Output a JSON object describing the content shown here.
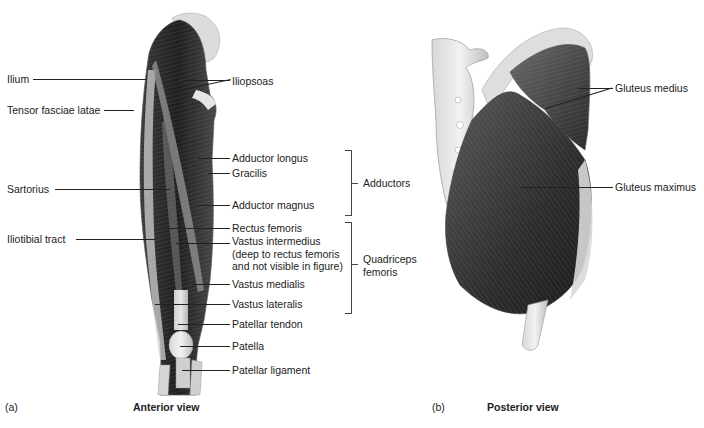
{
  "figure": {
    "panel_a": {
      "letter": "(a)",
      "title": "Anterior view",
      "left_labels": [
        {
          "id": "ilium",
          "text": "Ilium"
        },
        {
          "id": "tensor-fasciae-latae",
          "text": "Tensor fasciae latae"
        },
        {
          "id": "sartorius",
          "text": "Sartorius"
        },
        {
          "id": "iliotibial-tract",
          "text": "Iliotibial tract"
        }
      ],
      "right_labels": [
        {
          "id": "iliopsoas",
          "text": "Iliopsoas"
        },
        {
          "id": "adductor-longus",
          "text": "Adductor longus"
        },
        {
          "id": "gracilis",
          "text": "Gracilis"
        },
        {
          "id": "adductor-magnus",
          "text": "Adductor magnus"
        },
        {
          "id": "rectus-femoris",
          "text": "Rectus femoris"
        },
        {
          "id": "vastus-intermedius",
          "text": "Vastus intermedius\n(deep to rectus femoris\nand not visible in figure)"
        },
        {
          "id": "vastus-medialis",
          "text": "Vastus medialis"
        },
        {
          "id": "vastus-lateralis",
          "text": "Vastus lateralis"
        },
        {
          "id": "patellar-tendon",
          "text": "Patellar tendon"
        },
        {
          "id": "patella",
          "text": "Patella"
        },
        {
          "id": "patellar-ligament",
          "text": "Patellar ligament"
        }
      ],
      "groups": [
        {
          "id": "adductors",
          "text": "Adductors"
        },
        {
          "id": "quadriceps-femoris",
          "text": "Quadriceps\nfemoris"
        }
      ]
    },
    "panel_b": {
      "letter": "(b)",
      "title": "Posterior view",
      "labels": [
        {
          "id": "gluteus-medius",
          "text": "Gluteus medius"
        },
        {
          "id": "gluteus-maximus",
          "text": "Gluteus maximus"
        }
      ]
    }
  }
}
